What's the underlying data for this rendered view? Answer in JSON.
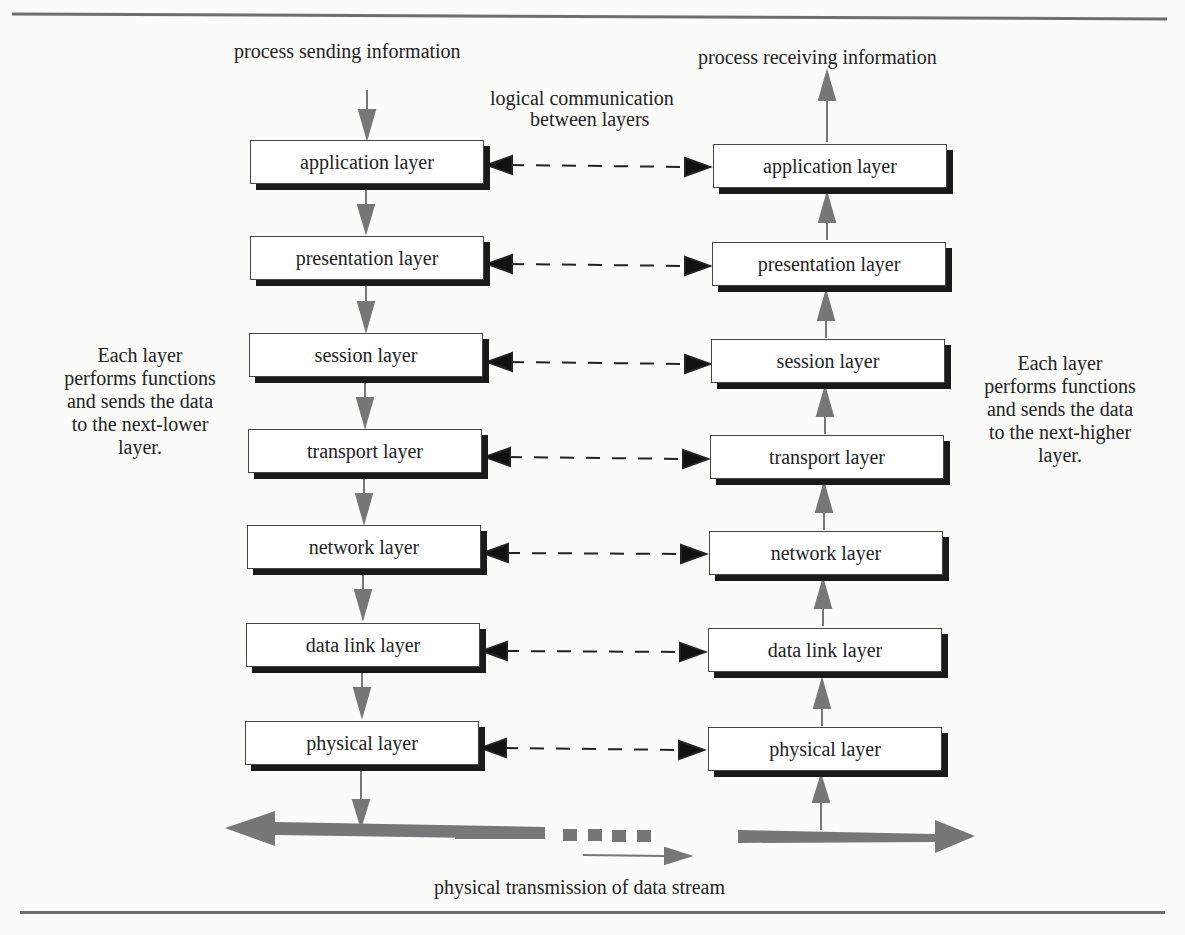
{
  "top_labels": {
    "sender": "process sending information",
    "receiver": "process receiving information",
    "logical_line1": "logical communication",
    "logical_line2": "between layers"
  },
  "side_notes": {
    "left": [
      "Each layer",
      "performs functions",
      "and sends the data",
      "to the next-lower",
      "layer."
    ],
    "right": [
      "Each layer",
      "performs functions",
      "and sends the data",
      "to the next-higher",
      "layer."
    ]
  },
  "layers": {
    "sender": [
      {
        "label": "application layer"
      },
      {
        "label": "presentation layer"
      },
      {
        "label": "session layer"
      },
      {
        "label": "transport layer"
      },
      {
        "label": "network layer"
      },
      {
        "label": "data link layer"
      },
      {
        "label": "physical layer"
      }
    ],
    "receiver": [
      {
        "label": "application layer"
      },
      {
        "label": "presentation layer"
      },
      {
        "label": "session layer"
      },
      {
        "label": "transport layer"
      },
      {
        "label": "network layer"
      },
      {
        "label": "data link layer"
      },
      {
        "label": "physical layer"
      }
    ]
  },
  "bottom_label": "physical transmission of data stream",
  "colors": {
    "arrow_gray": "#777777",
    "shadow": "#1a1a1a",
    "rule": "#6e6e6e"
  }
}
